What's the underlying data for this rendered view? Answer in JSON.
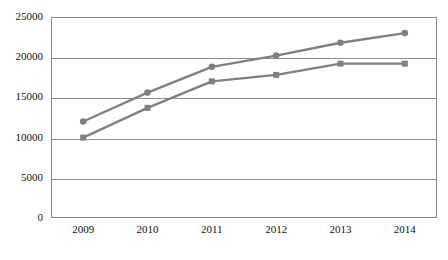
{
  "chart_data": {
    "type": "line",
    "title": "",
    "subtitle": "",
    "xlabel": "",
    "ylabel": "",
    "categories": [
      "2009",
      "2010",
      "2011",
      "2012",
      "2013",
      "2014"
    ],
    "x": [
      2009,
      2010,
      2011,
      2012,
      2013,
      2014
    ],
    "series": [
      {
        "name": "Series 1",
        "marker": "circle",
        "color": "#808080",
        "values": [
          12000,
          15600,
          18800,
          20200,
          21800,
          23000
        ]
      },
      {
        "name": "Series 2",
        "marker": "square",
        "color": "#808080",
        "values": [
          10000,
          13700,
          17000,
          17800,
          19200,
          19200
        ]
      }
    ],
    "ylim": [
      0,
      25000
    ],
    "ytick_values": [
      0,
      5000,
      10000,
      15000,
      20000,
      25000
    ],
    "ytick_labels": [
      "0",
      "5000",
      "10000",
      "15000",
      "20000",
      "25000"
    ],
    "xtick_labels": [
      "2009",
      "2010",
      "2011",
      "2012",
      "2013",
      "2014"
    ],
    "grid": {
      "horizontal": true,
      "vertical": false,
      "color": "#8f8f8f"
    },
    "legend": {
      "visible": false,
      "position": "none",
      "entries": []
    },
    "plot_border_color": "#8a8a8a",
    "background_color": "#ffffff",
    "line_width": 2.4,
    "marker_size": 6
  }
}
